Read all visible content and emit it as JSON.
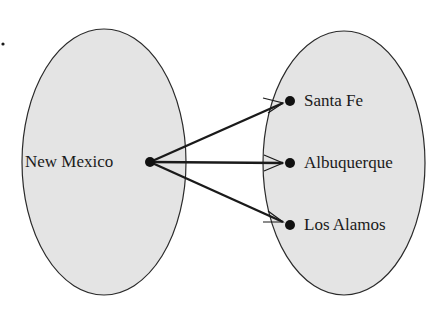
{
  "diagram": {
    "type": "mapping",
    "marker": "•",
    "domain_set": {
      "elements": [
        {
          "label": "New Mexico"
        }
      ]
    },
    "range_set": {
      "elements": [
        {
          "label": "Santa Fe"
        },
        {
          "label": "Albuquerque"
        },
        {
          "label": "Los Alamos"
        }
      ]
    },
    "arrows": [
      {
        "from": "New Mexico",
        "to": "Santa Fe"
      },
      {
        "from": "New Mexico",
        "to": "Albuquerque"
      },
      {
        "from": "New Mexico",
        "to": "Los Alamos"
      }
    ],
    "colors": {
      "set_fill": "#e4e4e4",
      "stroke": "#1a1a1a",
      "background": "#ffffff"
    }
  }
}
